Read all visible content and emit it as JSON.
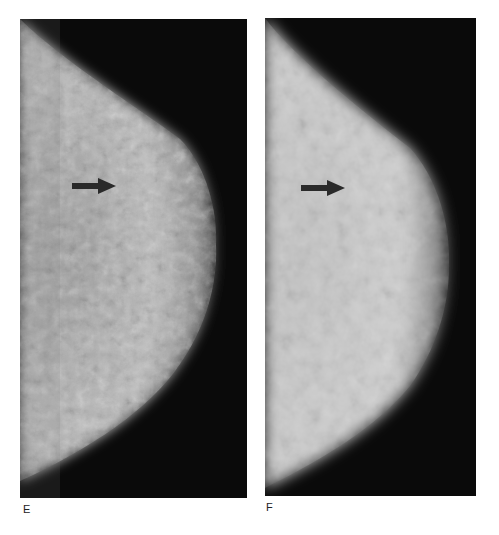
{
  "figure": {
    "panels": [
      {
        "id": "E",
        "label": "E",
        "description": "Mammogram, mediolateral view, dense fibroglandular tissue",
        "arrow": "arrow pointing right at lesion"
      },
      {
        "id": "F",
        "label": "F",
        "description": "Mammogram, mediolateral view, follow-up with more homogeneous density",
        "arrow": "arrow pointing right at lesion"
      }
    ],
    "colors": {
      "background": "#ffffff",
      "film": "#0a0a0a",
      "tissue": "#d8d8d8",
      "arrow": "#2a2a2a"
    }
  }
}
